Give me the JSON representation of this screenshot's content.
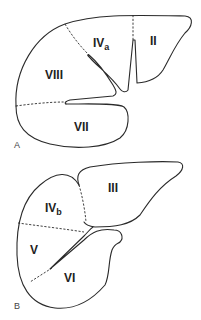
{
  "figure": {
    "panels": [
      {
        "id": "A",
        "label": "A",
        "segments": [
          {
            "name": "IV",
            "sub": "a"
          },
          {
            "name": "II",
            "sub": ""
          },
          {
            "name": "VIII",
            "sub": ""
          },
          {
            "name": "VII",
            "sub": ""
          }
        ]
      },
      {
        "id": "B",
        "label": "B",
        "segments": [
          {
            "name": "IV",
            "sub": "b"
          },
          {
            "name": "III",
            "sub": ""
          },
          {
            "name": "V",
            "sub": ""
          },
          {
            "name": "VI",
            "sub": ""
          }
        ]
      }
    ]
  }
}
